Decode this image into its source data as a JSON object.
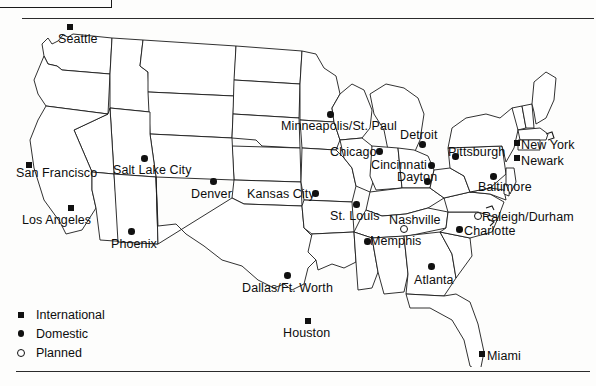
{
  "page": {
    "corner_box": "",
    "has_top_rule": true,
    "has_bottom_rule": true
  },
  "legend": {
    "items": [
      {
        "marker": "filled-square",
        "label": "International"
      },
      {
        "marker": "filled-circle",
        "label": "Domestic"
      },
      {
        "marker": "open-circle",
        "label": "Planned"
      }
    ]
  },
  "map": {
    "region": "Contiguous United States",
    "cities": [
      {
        "name": "Seattle",
        "marker": "filled-square",
        "mx": 67,
        "my": 24,
        "lx": 58,
        "ly": 33,
        "anchor": "left"
      },
      {
        "name": "San Francisco",
        "marker": "filled-square",
        "mx": 26,
        "my": 162,
        "lx": 16,
        "ly": 167,
        "anchor": "left"
      },
      {
        "name": "Los Angeles",
        "marker": "filled-square",
        "mx": 68,
        "my": 205,
        "lx": 22,
        "ly": 214,
        "anchor": "left"
      },
      {
        "name": "Phoenix",
        "marker": "filled-circle",
        "mx": 128,
        "my": 228,
        "lx": 111,
        "ly": 238,
        "anchor": "left"
      },
      {
        "name": "Salt Lake City",
        "marker": "filled-circle",
        "mx": 141,
        "my": 155,
        "lx": 113,
        "ly": 164,
        "anchor": "left"
      },
      {
        "name": "Denver",
        "marker": "filled-circle",
        "mx": 210,
        "my": 178,
        "lx": 191,
        "ly": 188,
        "anchor": "left"
      },
      {
        "name": "Kansas City",
        "marker": "filled-circle",
        "mx": 312,
        "my": 190,
        "lx": 247,
        "ly": 188,
        "anchor": "left"
      },
      {
        "name": "Minneapolis/St. Paul",
        "marker": "filled-circle",
        "mx": 327,
        "my": 111,
        "lx": 281,
        "ly": 120,
        "anchor": "left"
      },
      {
        "name": "Chicago",
        "marker": "filled-circle",
        "mx": 376,
        "my": 148,
        "lx": 330,
        "ly": 146,
        "anchor": "left"
      },
      {
        "name": "St. Louis",
        "marker": "filled-circle",
        "mx": 353,
        "my": 201,
        "lx": 330,
        "ly": 210,
        "anchor": "left"
      },
      {
        "name": "Detroit",
        "marker": "filled-circle",
        "mx": 419,
        "my": 141,
        "lx": 400,
        "ly": 129,
        "anchor": "left"
      },
      {
        "name": "Cincinnati",
        "marker": "filled-circle",
        "mx": 428,
        "my": 162,
        "lx": 371,
        "ly": 159,
        "anchor": "left"
      },
      {
        "name": "Dayton",
        "marker": "filled-circle",
        "mx": 424,
        "my": 178,
        "lx": 397,
        "ly": 171,
        "anchor": "left"
      },
      {
        "name": "Pittsburgh",
        "marker": "filled-circle",
        "mx": 452,
        "my": 153,
        "lx": 448,
        "ly": 146,
        "anchor": "left"
      },
      {
        "name": "New York",
        "marker": "filled-square",
        "mx": 514,
        "my": 140,
        "lx": 521,
        "ly": 139,
        "anchor": "left"
      },
      {
        "name": "Newark",
        "marker": "filled-square",
        "mx": 514,
        "my": 155,
        "lx": 521,
        "ly": 155,
        "anchor": "left"
      },
      {
        "name": "Baltimore",
        "marker": "filled-circle",
        "mx": 490,
        "my": 173,
        "lx": 478,
        "ly": 181,
        "anchor": "left"
      },
      {
        "name": "Nashville",
        "marker": "open-circle",
        "mx": 400,
        "my": 225,
        "lx": 389,
        "ly": 214,
        "anchor": "left"
      },
      {
        "name": "Memphis",
        "marker": "filled-circle",
        "mx": 364,
        "my": 238,
        "lx": 370,
        "ly": 235,
        "anchor": "left"
      },
      {
        "name": "Raleigh/Durham",
        "marker": "open-circle",
        "mx": 474,
        "my": 212,
        "lx": 482,
        "ly": 211,
        "anchor": "left"
      },
      {
        "name": "Charlotte",
        "marker": "filled-circle",
        "mx": 456,
        "my": 226,
        "lx": 464,
        "ly": 225,
        "anchor": "left"
      },
      {
        "name": "Atlanta",
        "marker": "filled-circle",
        "mx": 428,
        "my": 263,
        "lx": 414,
        "ly": 274,
        "anchor": "left"
      },
      {
        "name": "Dallas/Ft. Worth",
        "marker": "filled-circle",
        "mx": 284,
        "my": 272,
        "lx": 242,
        "ly": 282,
        "anchor": "left"
      },
      {
        "name": "Houston",
        "marker": "filled-square",
        "mx": 305,
        "my": 318,
        "lx": 283,
        "ly": 327,
        "anchor": "left"
      },
      {
        "name": "Miami",
        "marker": "filled-square",
        "mx": 479,
        "my": 351,
        "lx": 487,
        "ly": 350,
        "anchor": "left"
      }
    ]
  }
}
